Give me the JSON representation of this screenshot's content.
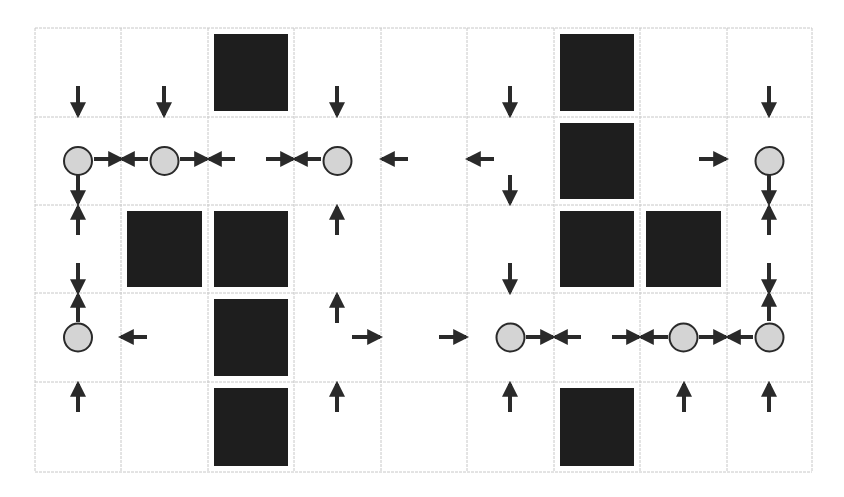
{
  "diagram": {
    "grid": {
      "rows": 5,
      "cols": 9,
      "col_edges": [
        35,
        121,
        208,
        294,
        381,
        467,
        554,
        640,
        727,
        812
      ],
      "row_edges": [
        28,
        117,
        205,
        293,
        382,
        472
      ],
      "line_color": "#c8c8c8",
      "background": "#ffffff"
    },
    "colors": {
      "obstacle": "#1e1e1e",
      "agent_fill": "#d4d4d4",
      "agent_stroke": "#2a2a2a",
      "arrow": "#2a2a2a"
    },
    "obstacles": [
      {
        "row": 0,
        "col": 2
      },
      {
        "row": 0,
        "col": 6
      },
      {
        "row": 1,
        "col": 6
      },
      {
        "row": 2,
        "col": 1
      },
      {
        "row": 2,
        "col": 2
      },
      {
        "row": 2,
        "col": 6
      },
      {
        "row": 2,
        "col": 7
      },
      {
        "row": 3,
        "col": 2
      },
      {
        "row": 4,
        "col": 2
      },
      {
        "row": 4,
        "col": 6
      }
    ],
    "agents": [
      {
        "row": 1,
        "col": 0
      },
      {
        "row": 1,
        "col": 1
      },
      {
        "row": 1,
        "col": 3
      },
      {
        "row": 1,
        "col": 8
      },
      {
        "row": 3,
        "col": 0
      },
      {
        "row": 3,
        "col": 5
      },
      {
        "row": 3,
        "col": 7
      },
      {
        "row": 3,
        "col": 8
      }
    ],
    "arrows": [
      {
        "dir": "down",
        "x1": 78,
        "y1": 86,
        "x2": 78,
        "y2": 115
      },
      {
        "dir": "down",
        "x1": 164,
        "y1": 86,
        "x2": 164,
        "y2": 115
      },
      {
        "dir": "down",
        "x1": 337,
        "y1": 86,
        "x2": 337,
        "y2": 115
      },
      {
        "dir": "down",
        "x1": 510,
        "y1": 86,
        "x2": 510,
        "y2": 115
      },
      {
        "dir": "down",
        "x1": 769,
        "y1": 86,
        "x2": 769,
        "y2": 115
      },
      {
        "dir": "right",
        "x1": 94,
        "y1": 159,
        "x2": 121,
        "y2": 159
      },
      {
        "dir": "left",
        "x1": 148,
        "y1": 159,
        "x2": 122,
        "y2": 159
      },
      {
        "dir": "right",
        "x1": 180,
        "y1": 159,
        "x2": 207,
        "y2": 159
      },
      {
        "dir": "left",
        "x1": 235,
        "y1": 159,
        "x2": 209,
        "y2": 159
      },
      {
        "dir": "right",
        "x1": 266,
        "y1": 159,
        "x2": 293,
        "y2": 159
      },
      {
        "dir": "left",
        "x1": 321,
        "y1": 159,
        "x2": 295,
        "y2": 159
      },
      {
        "dir": "left",
        "x1": 408,
        "y1": 159,
        "x2": 382,
        "y2": 159
      },
      {
        "dir": "left",
        "x1": 494,
        "y1": 159,
        "x2": 468,
        "y2": 159
      },
      {
        "dir": "right",
        "x1": 699,
        "y1": 159,
        "x2": 726,
        "y2": 159
      },
      {
        "dir": "down",
        "x1": 78,
        "y1": 175,
        "x2": 78,
        "y2": 203
      },
      {
        "dir": "down",
        "x1": 510,
        "y1": 175,
        "x2": 510,
        "y2": 203
      },
      {
        "dir": "down",
        "x1": 769,
        "y1": 175,
        "x2": 769,
        "y2": 203
      },
      {
        "dir": "up",
        "x1": 78,
        "y1": 235,
        "x2": 78,
        "y2": 207
      },
      {
        "dir": "up",
        "x1": 337,
        "y1": 235,
        "x2": 337,
        "y2": 207
      },
      {
        "dir": "up",
        "x1": 769,
        "y1": 235,
        "x2": 769,
        "y2": 207
      },
      {
        "dir": "down",
        "x1": 78,
        "y1": 263,
        "x2": 78,
        "y2": 292
      },
      {
        "dir": "down",
        "x1": 510,
        "y1": 263,
        "x2": 510,
        "y2": 292
      },
      {
        "dir": "down",
        "x1": 769,
        "y1": 263,
        "x2": 769,
        "y2": 292
      },
      {
        "dir": "up",
        "x1": 78,
        "y1": 322,
        "x2": 78,
        "y2": 295
      },
      {
        "dir": "left",
        "x1": 147,
        "y1": 337,
        "x2": 121,
        "y2": 337
      },
      {
        "dir": "up",
        "x1": 337,
        "y1": 323,
        "x2": 337,
        "y2": 295
      },
      {
        "dir": "right",
        "x1": 352,
        "y1": 337,
        "x2": 380,
        "y2": 337
      },
      {
        "dir": "right",
        "x1": 439,
        "y1": 337,
        "x2": 466,
        "y2": 337
      },
      {
        "dir": "right",
        "x1": 526,
        "y1": 337,
        "x2": 553,
        "y2": 337
      },
      {
        "dir": "left",
        "x1": 581,
        "y1": 337,
        "x2": 555,
        "y2": 337
      },
      {
        "dir": "right",
        "x1": 612,
        "y1": 337,
        "x2": 639,
        "y2": 337
      },
      {
        "dir": "left",
        "x1": 668,
        "y1": 337,
        "x2": 641,
        "y2": 337
      },
      {
        "dir": "right",
        "x1": 699,
        "y1": 337,
        "x2": 726,
        "y2": 337
      },
      {
        "dir": "left",
        "x1": 753,
        "y1": 337,
        "x2": 728,
        "y2": 337
      },
      {
        "dir": "up",
        "x1": 769,
        "y1": 321,
        "x2": 769,
        "y2": 294
      },
      {
        "dir": "up",
        "x1": 78,
        "y1": 412,
        "x2": 78,
        "y2": 384
      },
      {
        "dir": "up",
        "x1": 337,
        "y1": 412,
        "x2": 337,
        "y2": 384
      },
      {
        "dir": "up",
        "x1": 510,
        "y1": 412,
        "x2": 510,
        "y2": 384
      },
      {
        "dir": "up",
        "x1": 684,
        "y1": 412,
        "x2": 684,
        "y2": 384
      },
      {
        "dir": "up",
        "x1": 769,
        "y1": 412,
        "x2": 769,
        "y2": 384
      }
    ]
  }
}
